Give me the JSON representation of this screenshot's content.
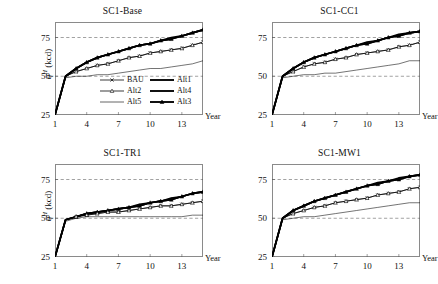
{
  "figure": {
    "axis": {
      "ylabel_sym": "q",
      "ylabel_sup": "H",
      "ylabel_unit": " (kcd)",
      "xlabel": "Year",
      "yticks": [
        25,
        50,
        75
      ],
      "xticks": [
        1,
        4,
        7,
        10,
        13
      ],
      "ylim": [
        25,
        85
      ],
      "xlim": [
        1,
        15
      ],
      "gridlines": [
        50,
        75
      ]
    },
    "legend": {
      "entries": [
        {
          "label": "BAU",
          "style": "thin-marker",
          "marker": "cross"
        },
        {
          "label": "Alt1",
          "style": "thick",
          "marker": "none"
        },
        {
          "label": "Alt2",
          "style": "thin-marker",
          "marker": "triangle-open"
        },
        {
          "label": "Alt4",
          "style": "thick",
          "marker": "none"
        },
        {
          "label": "Alt5",
          "style": "thin",
          "marker": "none"
        },
        {
          "label": "Alt3",
          "style": "thick-marker",
          "marker": "triangle-filled"
        }
      ]
    }
  },
  "chart_data": {
    "type": "line",
    "title": "",
    "xlabel": "Year",
    "ylabel": "q^H (kcd)",
    "xlim": [
      1,
      15
    ],
    "ylim": [
      25,
      85
    ],
    "xticks": [
      1,
      4,
      7,
      10,
      13
    ],
    "yticks": [
      25,
      50,
      75
    ],
    "grid": "horizontal-dashed at 50 and 75",
    "legend_position": "inside-top-left-panel",
    "x": [
      1,
      2,
      3,
      4,
      5,
      6,
      7,
      8,
      9,
      10,
      11,
      12,
      13,
      14,
      15
    ],
    "panels": [
      {
        "title": "SC1-Base",
        "series": [
          {
            "name": "Alt3",
            "values": [
              25,
              50,
              55,
              59,
              62,
              64,
              66,
              68,
              70,
              71,
              73,
              74,
              76,
              78,
              80
            ]
          },
          {
            "name": "Alt4",
            "values": [
              25,
              50,
              55,
              59,
              62,
              64,
              66,
              68,
              70,
              71,
              73,
              75,
              76,
              78,
              80
            ]
          },
          {
            "name": "Alt1",
            "values": [
              25,
              50,
              55,
              59,
              62,
              64,
              66,
              68,
              70,
              71,
              73,
              74,
              76,
              78,
              80
            ]
          },
          {
            "name": "BAU",
            "values": [
              25,
              50,
              53,
              55,
              57,
              58,
              60,
              62,
              63,
              65,
              66,
              67,
              68,
              70,
              72
            ]
          },
          {
            "name": "Alt2",
            "values": [
              25,
              50,
              53,
              55,
              57,
              58,
              60,
              62,
              63,
              65,
              66,
              67,
              68,
              70,
              72
            ]
          },
          {
            "name": "Alt5",
            "values": [
              25,
              49,
              50,
              50,
              51,
              51,
              52,
              53,
              54,
              55,
              55,
              56,
              57,
              58,
              60
            ]
          }
        ]
      },
      {
        "title": "SC1-CC1",
        "series": [
          {
            "name": "Alt3",
            "values": [
              25,
              50,
              55,
              59,
              62,
              64,
              66,
              68,
              70,
              71,
              73,
              75,
              76,
              78,
              79
            ]
          },
          {
            "name": "Alt4",
            "values": [
              25,
              50,
              55,
              59,
              62,
              64,
              66,
              68,
              70,
              72,
              73,
              75,
              77,
              78,
              79
            ]
          },
          {
            "name": "Alt1",
            "values": [
              25,
              50,
              55,
              59,
              62,
              64,
              66,
              68,
              70,
              71,
              73,
              75,
              76,
              78,
              79
            ]
          },
          {
            "name": "BAU",
            "values": [
              25,
              50,
              53,
              56,
              58,
              59,
              61,
              62,
              64,
              65,
              66,
              67,
              69,
              70,
              72
            ]
          },
          {
            "name": "Alt2",
            "values": [
              25,
              50,
              53,
              56,
              58,
              59,
              61,
              62,
              64,
              65,
              66,
              67,
              69,
              70,
              72
            ]
          },
          {
            "name": "Alt5",
            "values": [
              25,
              49,
              50,
              51,
              51,
              52,
              52,
              53,
              54,
              55,
              56,
              57,
              58,
              60,
              60
            ]
          }
        ]
      },
      {
        "title": "SC1-TR1",
        "series": [
          {
            "name": "Alt3",
            "values": [
              25,
              49,
              51,
              53,
              54,
              55,
              56,
              57,
              58,
              60,
              61,
              62,
              64,
              66,
              67
            ]
          },
          {
            "name": "Alt4",
            "values": [
              25,
              49,
              51,
              53,
              54,
              55,
              56,
              57,
              59,
              60,
              61,
              63,
              64,
              66,
              67
            ]
          },
          {
            "name": "Alt1",
            "values": [
              25,
              49,
              51,
              53,
              54,
              55,
              56,
              57,
              58,
              60,
              61,
              62,
              64,
              66,
              67
            ]
          },
          {
            "name": "BAU",
            "values": [
              25,
              49,
              51,
              52,
              53,
              54,
              54,
              55,
              56,
              57,
              58,
              58,
              59,
              60,
              61
            ]
          },
          {
            "name": "Alt2",
            "values": [
              25,
              49,
              51,
              52,
              53,
              54,
              54,
              55,
              56,
              57,
              58,
              58,
              59,
              60,
              61
            ]
          },
          {
            "name": "Alt5",
            "values": [
              25,
              48,
              50,
              51,
              51,
              51,
              51,
              51,
              51,
              51,
              51,
              51,
              51,
              52,
              52
            ]
          }
        ]
      },
      {
        "title": "SC1-MW1",
        "series": [
          {
            "name": "Alt3",
            "values": [
              25,
              50,
              55,
              58,
              61,
              63,
              65,
              67,
              69,
              71,
              72,
              74,
              75,
              77,
              78
            ]
          },
          {
            "name": "Alt4",
            "values": [
              25,
              50,
              55,
              58,
              61,
              63,
              65,
              67,
              69,
              71,
              73,
              74,
              76,
              77,
              78
            ]
          },
          {
            "name": "Alt1",
            "values": [
              25,
              50,
              55,
              58,
              61,
              63,
              65,
              67,
              69,
              71,
              72,
              74,
              75,
              77,
              78
            ]
          },
          {
            "name": "BAU",
            "values": [
              25,
              50,
              53,
              55,
              57,
              58,
              60,
              61,
              62,
              63,
              65,
              66,
              67,
              69,
              70
            ]
          },
          {
            "name": "Alt2",
            "values": [
              25,
              50,
              53,
              55,
              57,
              58,
              60,
              61,
              62,
              63,
              65,
              66,
              67,
              69,
              70
            ]
          },
          {
            "name": "Alt5",
            "values": [
              25,
              49,
              50,
              51,
              51,
              52,
              53,
              54,
              55,
              56,
              57,
              58,
              59,
              60,
              60
            ]
          }
        ]
      }
    ]
  }
}
